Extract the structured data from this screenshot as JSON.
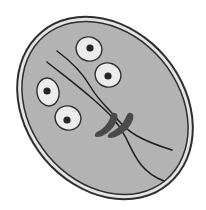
{
  "figure": {
    "width": 206,
    "height": 210,
    "colors": {
      "background": "#ffffff",
      "wall_outline": "#2e2e2e",
      "wall_band": "#e4e4e4",
      "cytoplasm": "#b3b3b3",
      "nucleus_fill": "#ececec",
      "nucleus_outline": "#303030",
      "karyosome": "#262626",
      "axoneme": "#1e1e1e",
      "median_body": "#4a4a4a"
    },
    "nuclei": [
      {
        "cx": 89,
        "cy": 49,
        "rx": 13,
        "ry": 12,
        "rot": 20,
        "dx": 90,
        "dy": 48
      },
      {
        "cx": 108,
        "cy": 75,
        "rx": 13,
        "ry": 12,
        "rot": 20,
        "dx": 108,
        "dy": 76
      },
      {
        "cx": 48,
        "cy": 92,
        "rx": 11,
        "ry": 14,
        "rot": -10,
        "dx": 47,
        "dy": 91
      },
      {
        "cx": 68,
        "cy": 118,
        "rx": 13,
        "ry": 12,
        "rot": 20,
        "dx": 67,
        "dy": 120
      }
    ]
  }
}
